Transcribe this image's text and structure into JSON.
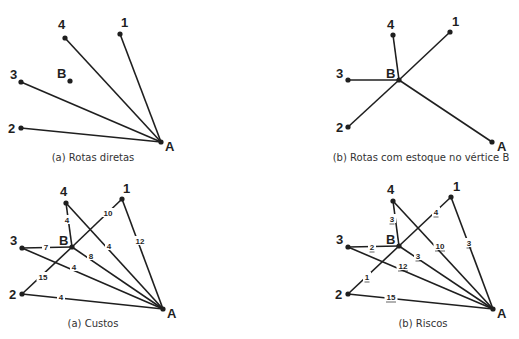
{
  "panels": [
    {
      "id": "rotas-diretas",
      "caption": "(a) Rotas diretas",
      "caption_pos": [
        93,
        161
      ],
      "nodes": [
        {
          "id": "4",
          "label": "4",
          "x": 65,
          "y": 38,
          "lx": 58,
          "ly": 29
        },
        {
          "id": "1",
          "label": "1",
          "x": 120,
          "y": 34,
          "lx": 121,
          "ly": 27
        },
        {
          "id": "3",
          "label": "3",
          "x": 21,
          "y": 82,
          "lx": 10,
          "ly": 79
        },
        {
          "id": "B",
          "label": "B",
          "x": 70,
          "y": 81,
          "lx": 57,
          "ly": 78
        },
        {
          "id": "2",
          "label": "2",
          "x": 21,
          "y": 128,
          "lx": 8,
          "ly": 133
        },
        {
          "id": "A",
          "label": "A",
          "x": 161,
          "y": 142,
          "lx": 165,
          "ly": 151
        }
      ],
      "edges": [
        {
          "from": "4",
          "to": "A"
        },
        {
          "from": "1",
          "to": "A"
        },
        {
          "from": "3",
          "to": "A"
        },
        {
          "from": "2",
          "to": "A"
        }
      ]
    },
    {
      "id": "rotas-com-estoque",
      "caption": "(b) Rotas com estoque no vértice B",
      "caption_pos": [
        421,
        161
      ],
      "nodes": [
        {
          "id": "4",
          "label": "4",
          "x": 393,
          "y": 35,
          "lx": 387,
          "ly": 29
        },
        {
          "id": "1",
          "label": "1",
          "x": 450,
          "y": 32,
          "lx": 452,
          "ly": 26
        },
        {
          "id": "3",
          "label": "3",
          "x": 348,
          "y": 80,
          "lx": 336,
          "ly": 78
        },
        {
          "id": "B",
          "label": "B",
          "x": 399,
          "y": 80,
          "lx": 386,
          "ly": 78
        },
        {
          "id": "2",
          "label": "2",
          "x": 348,
          "y": 127,
          "lx": 336,
          "ly": 132
        },
        {
          "id": "A",
          "label": "A",
          "x": 492,
          "y": 142,
          "lx": 497,
          "ly": 151
        }
      ],
      "edges": [
        {
          "from": "4",
          "to": "B"
        },
        {
          "from": "1",
          "to": "B"
        },
        {
          "from": "3",
          "to": "B"
        },
        {
          "from": "2",
          "to": "B"
        },
        {
          "from": "B",
          "to": "A"
        }
      ]
    },
    {
      "id": "custos",
      "caption": "(a) Custos",
      "caption_pos": [
        93,
        327
      ],
      "nodes": [
        {
          "id": "4",
          "label": "4",
          "x": 66,
          "y": 203,
          "lx": 60,
          "ly": 196
        },
        {
          "id": "1",
          "label": "1",
          "x": 122,
          "y": 199,
          "lx": 123,
          "ly": 193
        },
        {
          "id": "3",
          "label": "3",
          "x": 22,
          "y": 248,
          "lx": 10,
          "ly": 245
        },
        {
          "id": "B",
          "label": "B",
          "x": 72,
          "y": 247,
          "lx": 59,
          "ly": 245
        },
        {
          "id": "2",
          "label": "2",
          "x": 22,
          "y": 294,
          "lx": 9,
          "ly": 299
        },
        {
          "id": "A",
          "label": "A",
          "x": 163,
          "y": 309,
          "lx": 167,
          "ly": 318
        }
      ],
      "edges": [
        {
          "from": "4",
          "to": "B",
          "label": "4",
          "lx": 67,
          "ly": 220
        },
        {
          "from": "B",
          "to": "1",
          "label": "10",
          "lx": 108,
          "ly": 213
        },
        {
          "from": "3",
          "to": "B",
          "label": "7",
          "lx": 46,
          "ly": 247
        },
        {
          "from": "2",
          "to": "B",
          "label": "15",
          "lx": 43,
          "ly": 277
        },
        {
          "from": "1",
          "to": "A",
          "label": "12",
          "lx": 140,
          "ly": 241
        },
        {
          "from": "4",
          "to": "A",
          "label": "4",
          "lx": 109,
          "ly": 246
        },
        {
          "from": "B",
          "to": "A",
          "label": "8",
          "lx": 91,
          "ly": 256
        },
        {
          "from": "3",
          "to": "A",
          "label": "4",
          "lx": 74,
          "ly": 267
        },
        {
          "from": "2",
          "to": "A",
          "label": "4",
          "lx": 61,
          "ly": 297
        }
      ]
    },
    {
      "id": "riscos",
      "caption": "(b) Riscos",
      "caption_pos": [
        423,
        327
      ],
      "underline_labels": true,
      "nodes": [
        {
          "id": "4",
          "label": "4",
          "x": 393,
          "y": 201,
          "lx": 387,
          "ly": 194
        },
        {
          "id": "1",
          "label": "1",
          "x": 451,
          "y": 197,
          "lx": 453,
          "ly": 191
        },
        {
          "id": "3",
          "label": "3",
          "x": 348,
          "y": 247,
          "lx": 336,
          "ly": 244
        },
        {
          "id": "B",
          "label": "B",
          "x": 399,
          "y": 246,
          "lx": 386,
          "ly": 244
        },
        {
          "id": "2",
          "label": "2",
          "x": 348,
          "y": 294,
          "lx": 335,
          "ly": 299
        },
        {
          "id": "A",
          "label": "A",
          "x": 493,
          "y": 309,
          "lx": 497,
          "ly": 318
        }
      ],
      "edges": [
        {
          "from": "4",
          "to": "B",
          "label": "3",
          "lx": 392,
          "ly": 219
        },
        {
          "from": "B",
          "to": "1",
          "label": "4",
          "lx": 436,
          "ly": 212
        },
        {
          "from": "3",
          "to": "B",
          "label": "2",
          "lx": 372,
          "ly": 247
        },
        {
          "from": "2",
          "to": "B",
          "label": "1",
          "lx": 367,
          "ly": 277
        },
        {
          "from": "1",
          "to": "A",
          "label": "3",
          "lx": 469,
          "ly": 243
        },
        {
          "from": "4",
          "to": "A",
          "label": "10",
          "lx": 440,
          "ly": 246
        },
        {
          "from": "B",
          "to": "A",
          "label": "3",
          "lx": 418,
          "ly": 256
        },
        {
          "from": "3",
          "to": "A",
          "label": "12",
          "lx": 403,
          "ly": 266
        },
        {
          "from": "2",
          "to": "A",
          "label": "15",
          "lx": 391,
          "ly": 297
        }
      ]
    }
  ]
}
